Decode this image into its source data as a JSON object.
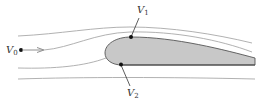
{
  "diagram": {
    "labels": {
      "v0": {
        "main": "V",
        "sub": "0"
      },
      "v1": {
        "main": "V",
        "sub": "1"
      },
      "v2": {
        "main": "V",
        "sub": "2"
      }
    },
    "colors": {
      "background": "#ffffff",
      "airfoil_fill": "#c8c8c8",
      "airfoil_stroke": "#555555",
      "streamline": "#a8a8a8",
      "arrow": "#909090",
      "point": "#111111",
      "leader": "#333333",
      "label": "#333333"
    },
    "elements": [
      "free-stream point V0 with flow arrow",
      "four streamlines",
      "airfoil (shaded)",
      "point V1 on upper surface",
      "point V2 on lower surface near leading edge"
    ]
  }
}
